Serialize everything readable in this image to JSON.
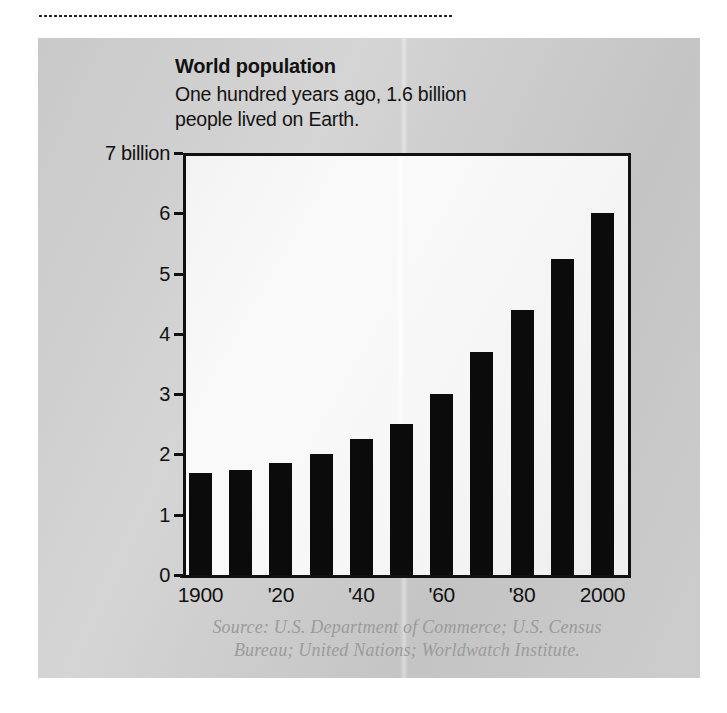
{
  "figure": {
    "title": "World population",
    "subtitle": "One hundred years ago, 1.6 billion people lived on Earth.",
    "source": "Source: U.S. Department of Commerce; U.S. Census Bureau; United Nations; Worldwatch Institute.",
    "source_line1": "Source: U.S. Department of Commerce; U.S. Census",
    "source_line2": "Bureau; United Nations; Worldwatch Institute.",
    "panel_color": "#cccccc",
    "bar_color": "#0b0b0b",
    "axis_color": "#111111"
  },
  "chart_data": {
    "type": "bar",
    "title": "World population",
    "subtitle": "One hundred years ago, 1.6 billion people lived on Earth.",
    "xlabel": "",
    "ylabel": "",
    "unit": "billion people",
    "categories": [
      "1900",
      "1910",
      "1920",
      "1930",
      "1940",
      "1950",
      "1960",
      "1970",
      "1980",
      "1990",
      "2000"
    ],
    "values": [
      1.7,
      1.75,
      1.85,
      2.0,
      2.25,
      2.5,
      3.0,
      3.7,
      4.4,
      5.25,
      6.0
    ],
    "ylim": [
      0,
      7
    ],
    "yticks": [
      0,
      1,
      2,
      3,
      4,
      5,
      6,
      7
    ],
    "ytick_labels": [
      "0",
      "1",
      "2",
      "3",
      "4",
      "5",
      "6",
      "7 billion"
    ],
    "xtick_labels": [
      "1900",
      "'20",
      "'40",
      "'60",
      "'80",
      "2000"
    ],
    "xtick_categories": [
      "1900",
      "1920",
      "1940",
      "1960",
      "1980",
      "2000"
    ],
    "grid": false,
    "legend": null
  }
}
